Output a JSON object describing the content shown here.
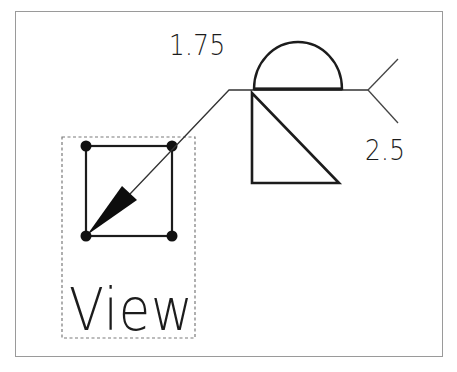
{
  "figure": {
    "frame_color": "#9a9a9a",
    "stroke_color": "#1c1c1c",
    "labels": {
      "upper_dimension": "1.75",
      "lower_dimension": "2.5",
      "view_label": "View"
    },
    "symbols": {
      "above_line": "semicircle-weld-symbol",
      "below_line": "right-triangle-fillet-weld-symbol",
      "tail": "reference-line-tail",
      "leader": "leader-arrow",
      "view_glyph": "square-with-corner-points"
    },
    "caption": {
      "visible": "cropped",
      "text": ""
    }
  }
}
